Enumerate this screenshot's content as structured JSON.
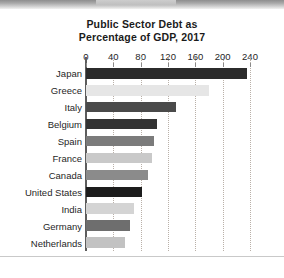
{
  "chart_data": {
    "type": "bar",
    "orientation": "horizontal",
    "title": "Public Sector Debt as Percentage of GDP, 2017",
    "title_line1": "Public Sector Debt as",
    "title_line2": "Percentage of GDP, 2017",
    "xlabel": "",
    "ylabel": "",
    "xlim": [
      0,
      240
    ],
    "grid": "vertical-dotted",
    "legend": "none",
    "tick_labels": [
      "0",
      "40",
      "80",
      "120",
      "160",
      "200",
      "240"
    ],
    "ticks": [
      0,
      40,
      80,
      120,
      160,
      200,
      240
    ],
    "categories": [
      "Japan",
      "Greece",
      "Italy",
      "Belgium",
      "Spain",
      "France",
      "Canada",
      "United States",
      "India",
      "Germany",
      "Netherlands"
    ],
    "values": [
      236,
      180,
      132,
      104,
      99,
      97,
      90,
      82,
      70,
      64,
      57
    ],
    "bar_colors": [
      "#2b2b2b",
      "#e6e6e6",
      "#4a4a4a",
      "#333333",
      "#7b7b7b",
      "#c9c9c9",
      "#8b8b8b",
      "#1c1c1c",
      "#d4d4d4",
      "#6e6e6e",
      "#c2c2c2"
    ]
  },
  "colors": {
    "axis": "#5d5d5d",
    "gridline": "#b9b0a8",
    "text": "#1f1f1f",
    "background": "#ffffff"
  }
}
